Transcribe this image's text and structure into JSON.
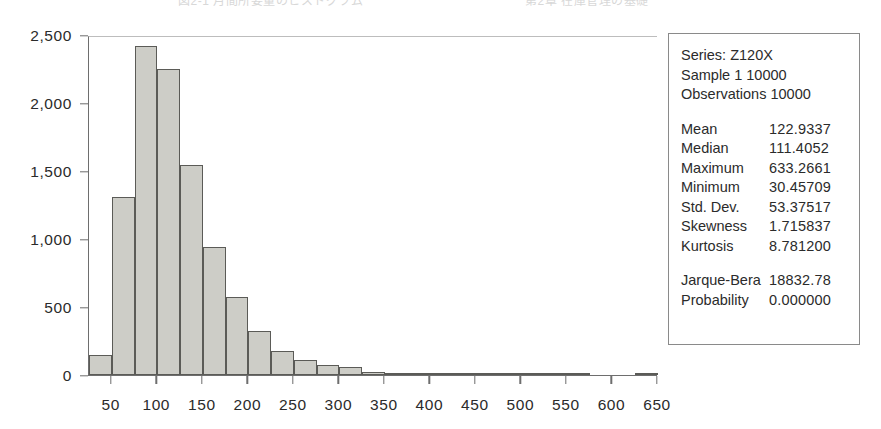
{
  "header": {
    "left_fragment": "図2-1 月間所要量のヒストグラム",
    "right_fragment": "第2章 在庫管理の基礎"
  },
  "stats": {
    "series_line": "Series: Z120X",
    "sample_line": "Sample 1 10000",
    "observations_line": "Observations 10000",
    "rows": [
      {
        "label": "Mean",
        "value": "122.9337"
      },
      {
        "label": "Median",
        "value": "111.4052"
      },
      {
        "label": "Maximum",
        "value": "633.2661"
      },
      {
        "label": "Minimum",
        "value": "30.45709"
      },
      {
        "label": "Std. Dev.",
        "value": "53.37517"
      },
      {
        "label": "Skewness",
        "value": "1.715837"
      },
      {
        "label": "Kurtosis",
        "value": "8.781200"
      }
    ],
    "test_rows": [
      {
        "label": "Jarque-Bera",
        "value": "18832.78"
      },
      {
        "label": "Probability",
        "value": "0.000000"
      }
    ]
  },
  "chart_data": {
    "type": "bar",
    "title": "",
    "subtitle": "",
    "xlabel": "",
    "ylabel": "",
    "orientation": "vertical",
    "grid": false,
    "legend_position": "none",
    "bar_fill_color": "#cdcdc7",
    "bar_border_color": "#5b5b57",
    "axis_color": "#6e6e6e",
    "bin_width": 50,
    "xlim": [
      25,
      650
    ],
    "ylim": [
      0,
      2500
    ],
    "x_ticks": [
      50,
      100,
      150,
      200,
      250,
      300,
      350,
      400,
      450,
      500,
      550,
      600,
      650
    ],
    "x_tick_labels": [
      "50",
      "100",
      "150",
      "200",
      "250",
      "300",
      "350",
      "400",
      "450",
      "500",
      "550",
      "600",
      "650"
    ],
    "y_ticks": [
      0,
      500,
      1000,
      1500,
      2000,
      2500
    ],
    "y_tick_labels": [
      "0",
      "500",
      "1,000",
      "1,500",
      "2,000",
      "2,500"
    ],
    "categories": [
      "25-50",
      "50-75",
      "75-100",
      "100-125",
      "125-150",
      "150-175",
      "175-200",
      "200-225",
      "225-250",
      "250-275",
      "275-300",
      "300-325",
      "325-350",
      "350-375",
      "375-400",
      "400-425",
      "425-450",
      "450-475",
      "475-500",
      "500-525",
      "525-550",
      "550-575",
      "575-600",
      "600-625",
      "625-650"
    ],
    "bin_edges": [
      25,
      50,
      75,
      100,
      125,
      150,
      175,
      200,
      225,
      250,
      275,
      300,
      325,
      350,
      375,
      400,
      425,
      450,
      475,
      500,
      525,
      550,
      575,
      600,
      625,
      650
    ],
    "values": [
      150,
      1310,
      2420,
      2250,
      1545,
      940,
      575,
      320,
      180,
      110,
      75,
      60,
      25,
      15,
      10,
      8,
      5,
      3,
      2,
      2,
      1,
      1,
      0,
      0,
      2
    ]
  }
}
